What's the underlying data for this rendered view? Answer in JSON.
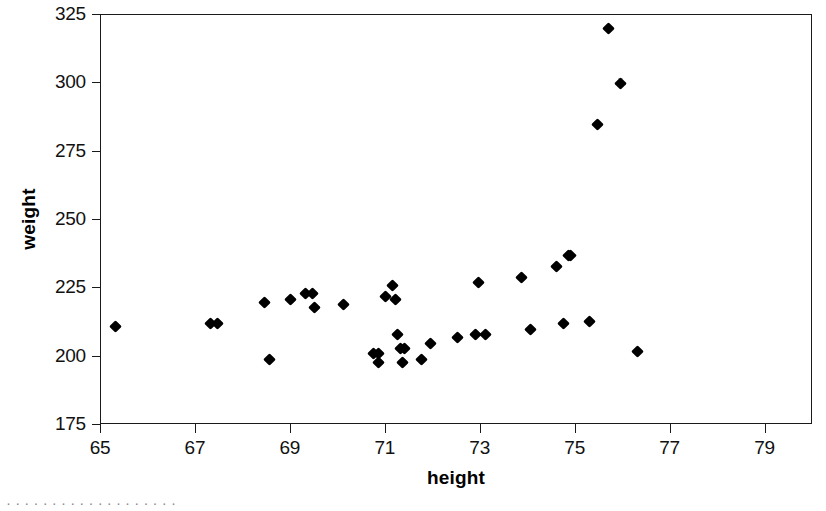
{
  "chart_data": {
    "type": "scatter",
    "title": "",
    "xlabel": "height",
    "ylabel": "weight",
    "xlim": [
      65,
      80
    ],
    "ylim": [
      175,
      325
    ],
    "xticks": [
      65,
      67,
      69,
      71,
      73,
      75,
      77,
      79
    ],
    "yticks": [
      175,
      200,
      225,
      250,
      275,
      300,
      325
    ],
    "grid": false,
    "legend": null,
    "marker": "diamond",
    "marker_color": "#000000",
    "points": [
      {
        "x": 65.3,
        "y": 211
      },
      {
        "x": 67.3,
        "y": 212
      },
      {
        "x": 67.45,
        "y": 212
      },
      {
        "x": 68.45,
        "y": 220
      },
      {
        "x": 68.55,
        "y": 199
      },
      {
        "x": 69.0,
        "y": 221
      },
      {
        "x": 69.3,
        "y": 223
      },
      {
        "x": 69.45,
        "y": 223
      },
      {
        "x": 69.5,
        "y": 218
      },
      {
        "x": 70.1,
        "y": 219
      },
      {
        "x": 70.75,
        "y": 201
      },
      {
        "x": 70.85,
        "y": 201
      },
      {
        "x": 70.85,
        "y": 198
      },
      {
        "x": 71.0,
        "y": 222
      },
      {
        "x": 71.15,
        "y": 226
      },
      {
        "x": 71.2,
        "y": 221
      },
      {
        "x": 71.25,
        "y": 208
      },
      {
        "x": 71.3,
        "y": 203
      },
      {
        "x": 71.4,
        "y": 203
      },
      {
        "x": 71.35,
        "y": 198
      },
      {
        "x": 71.75,
        "y": 199
      },
      {
        "x": 71.95,
        "y": 205
      },
      {
        "x": 72.5,
        "y": 207
      },
      {
        "x": 72.9,
        "y": 208
      },
      {
        "x": 72.95,
        "y": 227
      },
      {
        "x": 73.1,
        "y": 208
      },
      {
        "x": 73.85,
        "y": 229
      },
      {
        "x": 74.05,
        "y": 210
      },
      {
        "x": 74.6,
        "y": 233
      },
      {
        "x": 74.75,
        "y": 212
      },
      {
        "x": 74.85,
        "y": 237
      },
      {
        "x": 74.9,
        "y": 237
      },
      {
        "x": 75.3,
        "y": 213
      },
      {
        "x": 75.45,
        "y": 285
      },
      {
        "x": 75.7,
        "y": 320
      },
      {
        "x": 75.95,
        "y": 300
      },
      {
        "x": 76.3,
        "y": 202
      }
    ]
  },
  "axes": {
    "x_title": "height",
    "y_title": "weight",
    "x_tick_labels": [
      "65",
      "67",
      "69",
      "71",
      "73",
      "75",
      "77",
      "79"
    ],
    "y_tick_labels": [
      "175",
      "200",
      "225",
      "250",
      "275",
      "300",
      "325"
    ]
  },
  "caption": {
    "partial_text": "· · · · · · · · · · · · · · · · · · ·"
  },
  "colors": {
    "axis": "#1a1a1a",
    "marker": "#000000",
    "background": "#ffffff",
    "text": "#111111"
  }
}
